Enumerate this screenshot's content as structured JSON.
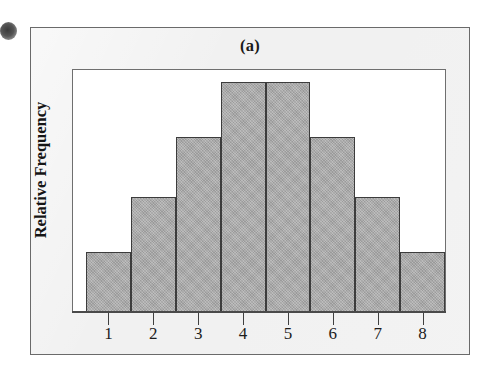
{
  "figure": {
    "panel_label": "(a)",
    "y_axis_title": "Relative Frequency",
    "bar_fill_color": "#a9a9a9",
    "bar_outline_color": "#3c3c3c",
    "panel_background_color": "#f1f1f1",
    "plot_background_color": "#ffffff",
    "frame_color": "#6a6a6a"
  },
  "chart_data": {
    "type": "bar",
    "title": "(a)",
    "xlabel": "",
    "ylabel": "Relative Frequency",
    "categories": [
      "1",
      "2",
      "3",
      "4",
      "5",
      "6",
      "7",
      "8"
    ],
    "values": [
      0.26,
      0.5,
      0.76,
      1.0,
      1.0,
      0.76,
      0.5,
      0.26
    ],
    "ylim": [
      0,
      1.0
    ],
    "grid": false,
    "legend": null
  },
  "axis": {
    "tick_labels": [
      "1",
      "2",
      "3",
      "4",
      "5",
      "6",
      "7",
      "8"
    ]
  }
}
